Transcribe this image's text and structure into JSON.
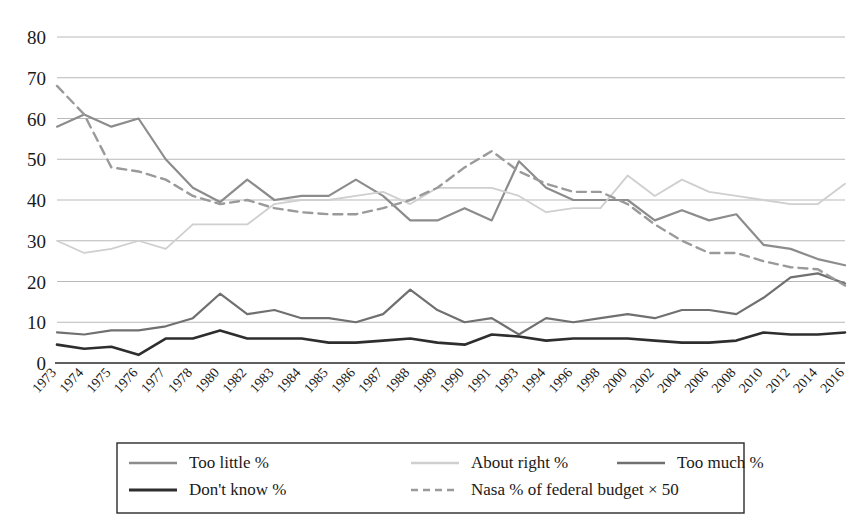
{
  "chart_data": {
    "type": "line",
    "title": "",
    "xlabel": "",
    "ylabel": "",
    "ylim": [
      0,
      80
    ],
    "ytick_values": [
      0,
      10,
      20,
      30,
      40,
      50,
      60,
      70,
      80
    ],
    "grid": true,
    "legend_position": "bottom",
    "categories": [
      "1973",
      "1974",
      "1975",
      "1976",
      "1977",
      "1978",
      "1980",
      "1982",
      "1983",
      "1984",
      "1985",
      "1986",
      "1987",
      "1988",
      "1989",
      "1990",
      "1991",
      "1993",
      "1994",
      "1996",
      "1998",
      "2000",
      "2002",
      "2004",
      "2006",
      "2008",
      "2010",
      "2012",
      "2014",
      "2016"
    ],
    "series": [
      {
        "name": "Too little %",
        "color": "#8c8c8c",
        "style": "solid",
        "values": [
          58,
          61,
          58,
          60,
          50,
          43,
          39.5,
          45,
          40,
          41,
          41,
          45,
          41,
          35,
          35,
          38,
          35,
          49.5,
          43,
          40,
          40,
          40,
          35,
          37.5,
          35,
          36.5,
          29,
          28,
          25.5,
          24
        ]
      },
      {
        "name": "About right %",
        "color": "#cfcfcf",
        "style": "solid",
        "values": [
          30,
          27,
          28,
          30,
          28,
          34,
          34,
          34,
          39,
          40,
          40,
          41,
          42,
          39,
          43,
          43,
          43,
          41,
          37,
          38,
          38,
          46,
          41,
          45,
          42,
          41,
          40,
          39,
          39,
          44
        ]
      },
      {
        "name": "Too much %",
        "color": "#707070",
        "style": "solid",
        "values": [
          7.5,
          7,
          8,
          8,
          9,
          11,
          17,
          12,
          13,
          11,
          11,
          10,
          12,
          18,
          13,
          10,
          11,
          7,
          11,
          10,
          11,
          12,
          11,
          13,
          13,
          12,
          16,
          21,
          22,
          19.5
        ]
      },
      {
        "name": "Don't know %",
        "color": "#2e2e2e",
        "style": "solid",
        "values": [
          4.5,
          3.5,
          4,
          2,
          6,
          6,
          8,
          6,
          6,
          6,
          5,
          5,
          5.5,
          6,
          5,
          4.5,
          7,
          6.5,
          5.5,
          6,
          6,
          6,
          5.5,
          5,
          5,
          5.5,
          7.5,
          7,
          7,
          7.5
        ]
      },
      {
        "name": "Nasa % of federal budget × 50",
        "color": "#9a9a9a",
        "style": "dashed",
        "values": [
          68,
          61,
          48,
          47,
          45,
          41,
          39,
          40,
          38,
          37,
          36.5,
          36.5,
          38,
          40,
          43,
          48,
          52,
          47,
          44,
          42,
          42,
          39,
          34,
          30,
          27,
          27,
          25,
          23.5,
          23,
          19
        ]
      }
    ],
    "legend": [
      {
        "label": "Too little %",
        "color": "#8c8c8c",
        "style": "solid"
      },
      {
        "label": "About right %",
        "color": "#cfcfcf",
        "style": "solid"
      },
      {
        "label": "Too much %",
        "color": "#707070",
        "style": "solid"
      },
      {
        "label": "Don't know %",
        "color": "#2e2e2e",
        "style": "solid"
      },
      {
        "label": "Nasa % of federal budget × 50",
        "color": "#9a9a9a",
        "style": "dashed"
      }
    ]
  }
}
